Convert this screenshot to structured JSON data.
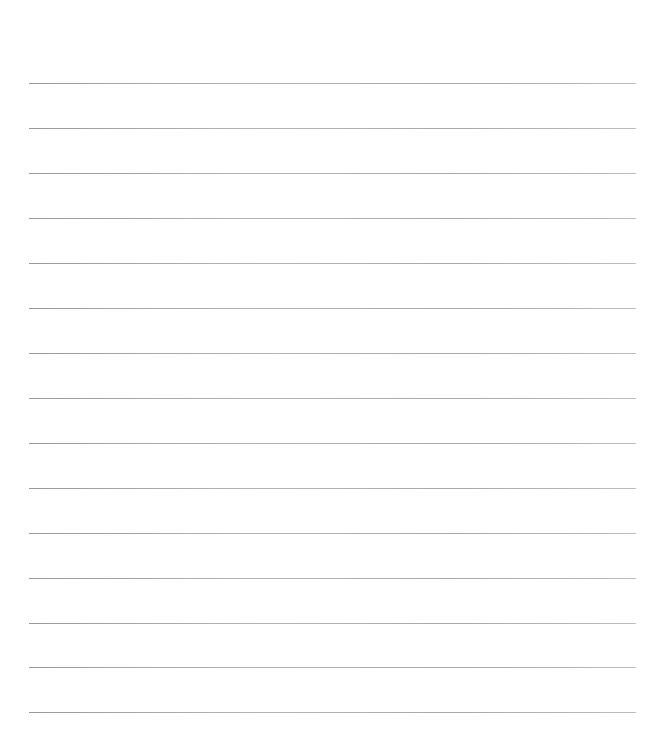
{
  "page": {
    "type": "blank lined paper",
    "line_count": 15,
    "line_color": "#a8a8a8",
    "background": "#ffffff",
    "lines_y": [
      83,
      128,
      173,
      218,
      263,
      308,
      353,
      398,
      443,
      488,
      533,
      578,
      623,
      667,
      712
    ]
  }
}
